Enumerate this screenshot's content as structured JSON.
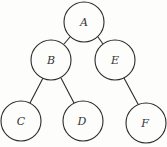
{
  "diagram": {
    "type": "binary-tree",
    "nodes": [
      {
        "id": "A",
        "label": "A",
        "cx": 84,
        "cy": 22
      },
      {
        "id": "B",
        "label": "B",
        "cx": 51,
        "cy": 60
      },
      {
        "id": "E",
        "label": "E",
        "cx": 115,
        "cy": 60
      },
      {
        "id": "C",
        "label": "C",
        "cx": 21,
        "cy": 121
      },
      {
        "id": "D",
        "label": "D",
        "cx": 83,
        "cy": 121
      },
      {
        "id": "F",
        "label": "F",
        "cx": 146,
        "cy": 123
      }
    ],
    "edges": [
      {
        "from": "A",
        "to": "B"
      },
      {
        "from": "A",
        "to": "E"
      },
      {
        "from": "B",
        "to": "C"
      },
      {
        "from": "B",
        "to": "D"
      },
      {
        "from": "E",
        "to": "F"
      }
    ],
    "node_radius": 20,
    "stroke_color": "#2a2a2a",
    "background": "#fdfdfb"
  }
}
